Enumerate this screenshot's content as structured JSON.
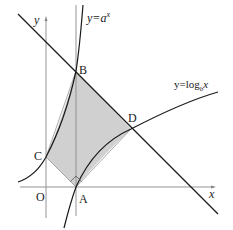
{
  "axes": {
    "x_label": "x",
    "y_label": "y",
    "origin_label": "O"
  },
  "curves": {
    "exp": {
      "label_prefix": "y=",
      "base": "a",
      "exponent": "x"
    },
    "log": {
      "label_prefix": "y=log",
      "base": "b",
      "arg": "x"
    }
  },
  "points": {
    "A": "A",
    "B": "B",
    "C": "C",
    "D": "D"
  },
  "colors": {
    "shade": "#d0d0d0",
    "curve": "#1a1a1a",
    "axis": "#888888"
  }
}
